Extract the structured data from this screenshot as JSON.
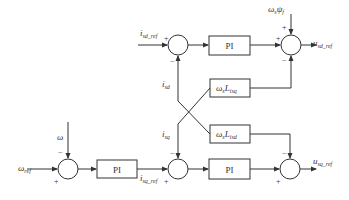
{
  "diagram": {
    "blocks": {
      "pi_d": "PI",
      "pi_q": "PI",
      "pi_speed": "PI",
      "cross_q": {
        "main": "ω",
        "sub1": "s",
        "mid": "L",
        "sub2": "isq"
      },
      "cross_d": {
        "main": "ω",
        "sub1": "s",
        "mid": "L",
        "sub2": "isd"
      }
    },
    "signals": {
      "isd_ref": {
        "main": "i",
        "sub": "sd_ref"
      },
      "isd": {
        "main": "i",
        "sub": "sd"
      },
      "isq": {
        "main": "i",
        "sub": "sq"
      },
      "isq_ref": {
        "main": "i",
        "sub": "sq_ref"
      },
      "usd_ref": {
        "main": "u",
        "sub": "sd_ref"
      },
      "usq_ref": {
        "main": "u",
        "sub": "sq_ref"
      },
      "omega": {
        "main": "ω",
        "sub": ""
      },
      "omega_ref": {
        "main": "ω",
        "sub": "ref"
      },
      "flux": {
        "main": "ω",
        "sub1": "s",
        "mid": "ψ",
        "sub2": "f"
      }
    },
    "signs": {
      "plus": "+",
      "minus": "−"
    }
  }
}
